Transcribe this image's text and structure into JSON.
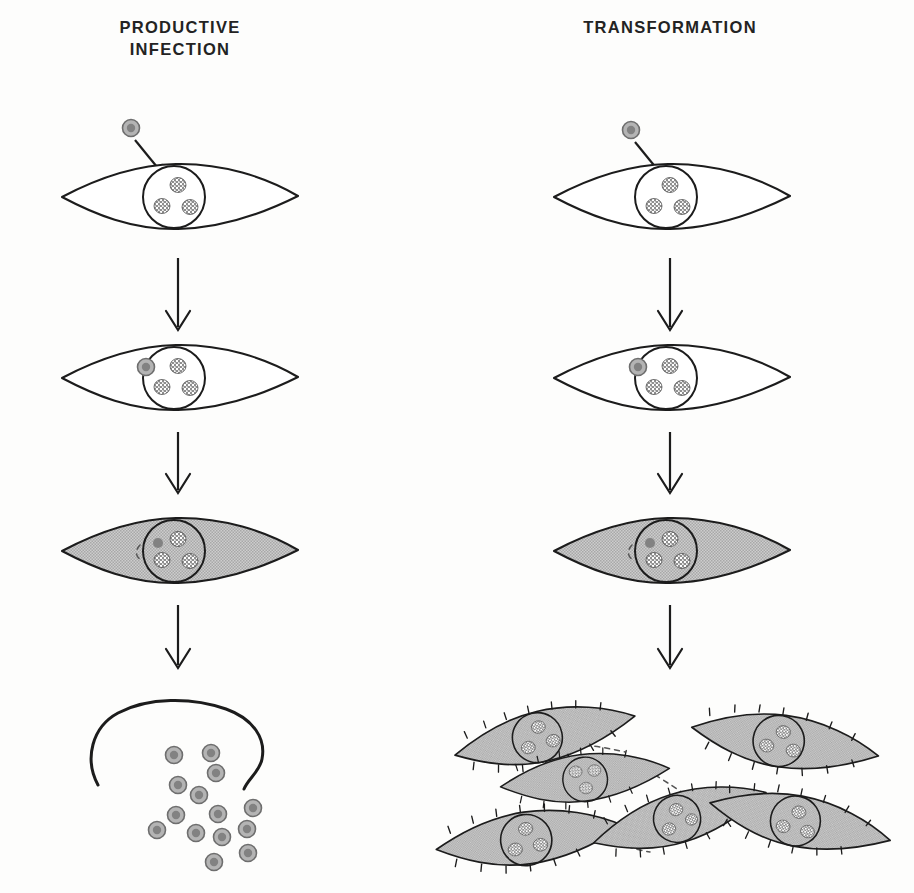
{
  "figure": {
    "kind": "biology-schematic",
    "background_color": "#fdfdfc",
    "ink_color": "#1c1c1c",
    "cell_shade_color": "#c0c0c0",
    "virion_ring_color": "#b4b4b4",
    "virion_core_color": "#828282"
  },
  "columns": [
    {
      "id": "productive-infection",
      "title": "PRODUCTIVE\nINFECTION",
      "center_x": 180,
      "stages": [
        {
          "index": 1,
          "name": "virus-entry",
          "cell_shaded": false,
          "free_virion_above": true,
          "virion_in_nucleus": false,
          "nucleoli_count": 3
        },
        {
          "index": 2,
          "name": "virion-at-nucleus",
          "cell_shaded": false,
          "free_virion_above": false,
          "virion_in_nucleus": true,
          "nucleoli_count": 3
        },
        {
          "index": 3,
          "name": "infected-altered-cell",
          "cell_shaded": true,
          "free_virion_above": false,
          "virion_in_nucleus": true,
          "nucleoli_count": 3
        },
        {
          "index": 4,
          "name": "cell-lysis-virion-release",
          "cell_shaded": false,
          "lysed": true,
          "released_virion_count": 14
        }
      ],
      "arrow_count": 3
    },
    {
      "id": "transformation",
      "title": "TRANSFORMATION",
      "center_x": 670,
      "stages": [
        {
          "index": 1,
          "name": "virus-entry",
          "cell_shaded": false,
          "free_virion_above": true,
          "virion_in_nucleus": false,
          "nucleoli_count": 3
        },
        {
          "index": 2,
          "name": "virion-at-nucleus",
          "cell_shaded": false,
          "free_virion_above": false,
          "virion_in_nucleus": true,
          "nucleoli_count": 3
        },
        {
          "index": 3,
          "name": "infected-altered-cell",
          "cell_shaded": true,
          "free_virion_above": false,
          "virion_in_nucleus": true,
          "nucleoli_count": 3
        },
        {
          "index": 4,
          "name": "transformed-focus",
          "cell_shaded": true,
          "transformed_cell_count": 6,
          "spiky_membrane": true,
          "piled_up_overlapping": true
        }
      ],
      "arrow_count": 3
    }
  ],
  "legend_note": ""
}
